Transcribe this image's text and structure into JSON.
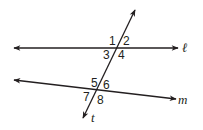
{
  "diagram": {
    "type": "parallel-lines-transversal",
    "stroke_color": "#231f20",
    "lines": {
      "l": {
        "label": "ℓ",
        "x1": 14,
        "y1": 48,
        "x2": 178,
        "y2": 48
      },
      "m": {
        "label": "m",
        "x1": 14,
        "y1": 80,
        "x2": 176,
        "y2": 99
      },
      "t": {
        "label": "t",
        "x1": 135,
        "y1": 10,
        "x2": 83,
        "y2": 118
      }
    },
    "angles": [
      {
        "id": "1",
        "label": "1"
      },
      {
        "id": "2",
        "label": "2"
      },
      {
        "id": "3",
        "label": "3"
      },
      {
        "id": "4",
        "label": "4"
      },
      {
        "id": "5",
        "label": "5"
      },
      {
        "id": "6",
        "label": "6"
      },
      {
        "id": "7",
        "label": "7"
      },
      {
        "id": "8",
        "label": "8"
      }
    ]
  }
}
